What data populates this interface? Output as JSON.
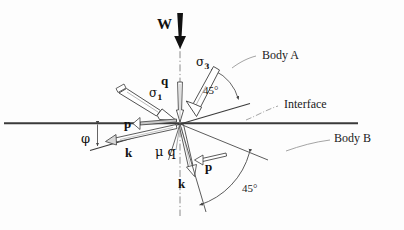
{
  "figure": {
    "background_color": "#fdfdfd",
    "line_color": "#2b2b2b",
    "text_color": "#111111"
  },
  "labels": {
    "weight": "W",
    "sigma1": "σ",
    "sigma1_sub": "1",
    "sigma3": "σ",
    "sigma3_sub": "3",
    "q_upper": "q",
    "mu_q": "μ q",
    "p_left": "p",
    "p_lower": "p",
    "k_left": "k",
    "k_lower": "k",
    "phi": "φ",
    "angle_upper": "45°",
    "angle_lower": "45°",
    "body_a": "Body A",
    "body_b": "Body B",
    "interface": "Interface"
  },
  "geometry": {
    "origin": {
      "x": 180,
      "y": 123
    },
    "interface_line": {
      "x1": 4,
      "y1": 123,
      "x2": 358,
      "y2": 123
    },
    "vertical_axis": {
      "x": 180,
      "y_top": 38,
      "y_bottom": 215
    },
    "inclined_interface": {
      "x1": 90,
      "y1": 150,
      "x2": 248,
      "y2": 104
    },
    "phi_angle_deg": 16,
    "upper_angle_deg": 45,
    "lower_angle_deg": 45
  },
  "annotations": {
    "weight_arrow": "thick-down-arrow",
    "upper_arc": "45-degree-arc-upper",
    "lower_arc": "45-degree-arc-lower",
    "phi_marker": "double-headed-vertical-arrow"
  }
}
